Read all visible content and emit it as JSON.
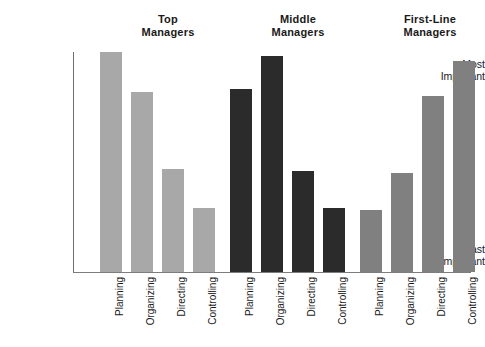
{
  "chart_data": {
    "type": "bar",
    "title": "",
    "subtitle": "",
    "xlabel": "",
    "ylabel": "",
    "grid": false,
    "legend_position": "none",
    "orientation": "vertical",
    "ylim": [
      0,
      100
    ],
    "y_tick_labels": [
      "Least\nImportant",
      "Most\nImportant"
    ],
    "y_tick_values": [
      0,
      100
    ],
    "categories": [
      "Planning",
      "Organizing",
      "Directing",
      "Controlling"
    ],
    "group_labels": [
      "Top\nManagers",
      "Middle\nManagers",
      "First-Line\nManagers"
    ],
    "series": [
      {
        "name": "Top Managers",
        "color": "#a8a8a8",
        "values": [
          100,
          82,
          47,
          29
        ]
      },
      {
        "name": "Middle Managers",
        "color": "#2b2b2b",
        "values": [
          83,
          98,
          46,
          29
        ]
      },
      {
        "name": "First-Line Managers",
        "color": "#808080",
        "values": [
          28,
          45,
          80,
          96
        ]
      }
    ],
    "annotations": []
  },
  "colors": {
    "top_managers_bar": "#a8a8a8",
    "middle_managers_bar": "#2b2b2b",
    "first_line_managers_bar": "#808080",
    "axis_line": "#7d7d7d",
    "text": "#1a1a1a",
    "background": "#ffffff"
  },
  "axis": {
    "y_top_label": "Most\nImportant",
    "y_bottom_label": "Least\nImportant"
  },
  "groups": [
    {
      "title": "Top\nManagers",
      "bars": [
        {
          "label": "Planning",
          "value": 100
        },
        {
          "label": "Organizing",
          "value": 82
        },
        {
          "label": "Directing",
          "value": 47
        },
        {
          "label": "Controlling",
          "value": 29
        }
      ]
    },
    {
      "title": "Middle\nManagers",
      "bars": [
        {
          "label": "Planning",
          "value": 83
        },
        {
          "label": "Organizing",
          "value": 98
        },
        {
          "label": "Directing",
          "value": 46
        },
        {
          "label": "Controlling",
          "value": 29
        }
      ]
    },
    {
      "title": "First-Line\nManagers",
      "bars": [
        {
          "label": "Planning",
          "value": 28
        },
        {
          "label": "Organizing",
          "value": 45
        },
        {
          "label": "Directing",
          "value": 80
        },
        {
          "label": "Controlling",
          "value": 96
        }
      ]
    }
  ]
}
